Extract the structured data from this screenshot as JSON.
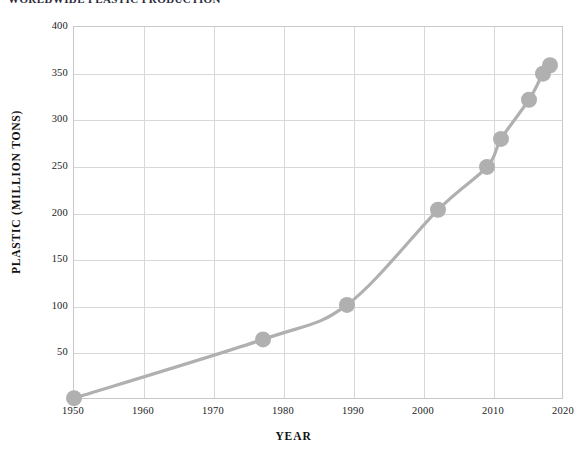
{
  "chart_data": {
    "type": "line",
    "title": "WORLDWIDE PLASTIC PRODUCTION",
    "xlabel": "YEAR",
    "ylabel": "PLASTIC (MILLION TONS)",
    "xlim": [
      1950,
      2020
    ],
    "ylim": [
      0,
      400
    ],
    "grid": true,
    "legend": "none",
    "line_color": "#b0b0b0",
    "marker_color": "#b0b0b0",
    "marker_shape": "circle",
    "x_ticks": [
      1950,
      1960,
      1970,
      1980,
      1990,
      2000,
      2010,
      2020
    ],
    "x_tick_labels": [
      "1950",
      "1960",
      "1970",
      "1980",
      "1990",
      "2000",
      "2010",
      "2020"
    ],
    "y_ticks": [
      50,
      100,
      150,
      200,
      250,
      300,
      350,
      400
    ],
    "y_tick_labels": [
      "50",
      "100",
      "150",
      "200",
      "250",
      "300",
      "350",
      "400"
    ],
    "series": [
      {
        "name": "Global plastic production",
        "x": [
          1950,
          1977,
          1989,
          2002,
          2009,
          2011,
          2015,
          2017,
          2018
        ],
        "values": [
          2,
          65,
          102,
          204,
          250,
          280,
          322,
          350,
          359
        ]
      }
    ],
    "points": [
      {
        "year": 1950,
        "value": 2
      },
      {
        "year": 1977,
        "value": 65
      },
      {
        "year": 1989,
        "value": 102
      },
      {
        "year": 2002,
        "value": 204
      },
      {
        "year": 2009,
        "value": 250
      },
      {
        "year": 2011,
        "value": 280
      },
      {
        "year": 2015,
        "value": 322
      },
      {
        "year": 2017,
        "value": 350
      },
      {
        "year": 2018,
        "value": 359
      }
    ]
  }
}
